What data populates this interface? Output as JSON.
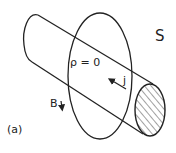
{
  "figure": {
    "panel_label": "(a)",
    "region_label": "S",
    "density_label": "ρ = 0",
    "current_label": "j",
    "field_label": "B"
  },
  "colors": {
    "stroke": "#222222",
    "background": "#ffffff",
    "hatch": "#444444"
  }
}
